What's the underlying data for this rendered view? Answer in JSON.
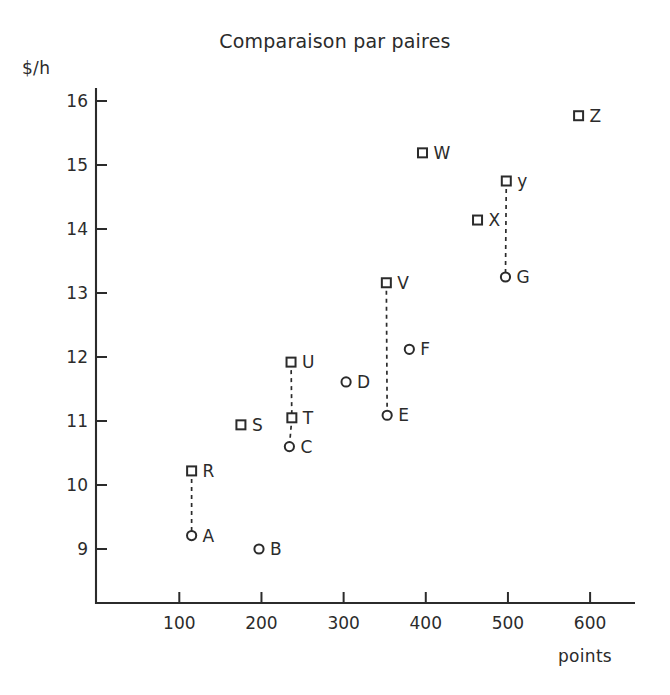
{
  "chart_data": {
    "type": "scatter",
    "title": "Comparaison par paires",
    "xlabel": "points",
    "ylabel": "$/h",
    "xlim": [
      0,
      655
    ],
    "ylim": [
      8.45,
      16.3
    ],
    "grid": false,
    "legend": "none",
    "xticks": [
      100,
      200,
      300,
      400,
      500,
      600
    ],
    "xtick_labels": [
      "100",
      "200",
      "300",
      "400",
      "500",
      "600"
    ],
    "yticks": [
      9,
      10,
      11,
      12,
      13,
      14,
      15,
      16
    ],
    "ytick_labels": [
      "9",
      "10",
      "11",
      "12",
      "13",
      "14",
      "15",
      "16"
    ],
    "marker_shapes": {
      "square": "open-square",
      "circle": "open-circle"
    },
    "points": [
      {
        "label": "A",
        "x": 115,
        "y": 9.21,
        "marker": "circle",
        "label_dx": 11,
        "label_dy": 6
      },
      {
        "label": "B",
        "x": 197,
        "y": 9.0,
        "marker": "circle",
        "label_dx": 11,
        "label_dy": 6
      },
      {
        "label": "C",
        "x": 234,
        "y": 10.6,
        "marker": "circle",
        "label_dx": 11,
        "label_dy": 6
      },
      {
        "label": "D",
        "x": 303,
        "y": 11.61,
        "marker": "circle",
        "label_dx": 11,
        "label_dy": 6
      },
      {
        "label": "E",
        "x": 353,
        "y": 11.09,
        "marker": "circle",
        "label_dx": 11,
        "label_dy": 6
      },
      {
        "label": "F",
        "x": 380,
        "y": 12.12,
        "marker": "circle",
        "label_dx": 11,
        "label_dy": 6
      },
      {
        "label": "G",
        "x": 497,
        "y": 13.25,
        "marker": "circle",
        "label_dx": 11,
        "label_dy": 6
      },
      {
        "label": "R",
        "x": 115,
        "y": 10.22,
        "marker": "square",
        "label_dx": 11,
        "label_dy": 6
      },
      {
        "label": "S",
        "x": 175,
        "y": 10.94,
        "marker": "square",
        "label_dx": 11,
        "label_dy": 6
      },
      {
        "label": "T",
        "x": 237,
        "y": 11.05,
        "marker": "square",
        "label_dx": 11,
        "label_dy": 6
      },
      {
        "label": "U",
        "x": 236,
        "y": 11.92,
        "marker": "square",
        "label_dx": 11,
        "label_dy": 6
      },
      {
        "label": "V",
        "x": 352,
        "y": 13.16,
        "marker": "square",
        "label_dx": 11,
        "label_dy": 6
      },
      {
        "label": "W",
        "x": 396,
        "y": 15.19,
        "marker": "square",
        "label_dx": 11,
        "label_dy": 6
      },
      {
        "label": "X",
        "x": 463,
        "y": 14.14,
        "marker": "square",
        "label_dx": 11,
        "label_dy": 6
      },
      {
        "label": "y",
        "x": 498,
        "y": 14.75,
        "marker": "square",
        "label_dx": 11,
        "label_dy": 6
      },
      {
        "label": "Z",
        "x": 586,
        "y": 15.77,
        "marker": "square",
        "label_dx": 11,
        "label_dy": 6
      }
    ],
    "pairs": [
      {
        "from": "R",
        "to": "A"
      },
      {
        "from": "U",
        "to": "T"
      },
      {
        "from": "T",
        "to": "C"
      },
      {
        "from": "V",
        "to": "E"
      },
      {
        "from": "y",
        "to": "G"
      }
    ]
  },
  "axes": {
    "x_axis_name": "points-axis",
    "y_axis_name": "dollars-per-hour-axis"
  }
}
